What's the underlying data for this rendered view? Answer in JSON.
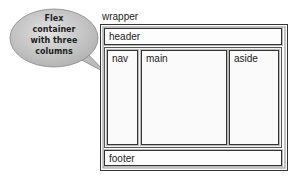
{
  "callout": {
    "lines": [
      "Flex",
      "container",
      "with three",
      "columns"
    ]
  },
  "wrapper": {
    "label": "wrapper",
    "header": "header",
    "flex_container": {
      "columns": [
        {
          "name": "nav"
        },
        {
          "name": "main"
        },
        {
          "name": "aside"
        }
      ]
    },
    "footer": "footer"
  },
  "colors": {
    "bubble_fill": "#c8c8c8",
    "border": "#333333",
    "background": "#ffffff"
  }
}
